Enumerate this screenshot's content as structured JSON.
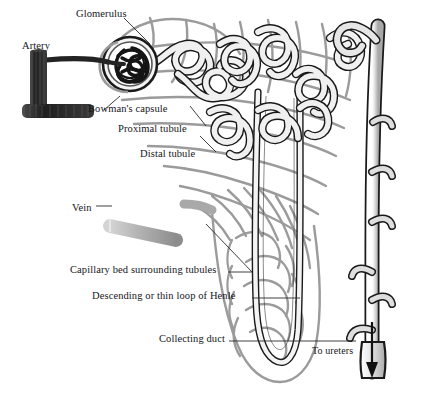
{
  "figure": {
    "alt": "Anatomical illustration of a kidney nephron showing glomerulus, Bowman's capsule, proximal and distal tubules, loop of Henle, surrounding capillary bed, collecting duct, artery and vein"
  },
  "labels": [
    {
      "id": "glomerulus",
      "text": "Glomerulus",
      "x": 76,
      "y": 8
    },
    {
      "id": "artery",
      "text": "Artery",
      "x": 22,
      "y": 40
    },
    {
      "id": "bowmans-capsule",
      "text": "Bowman's capsule",
      "x": 88,
      "y": 103
    },
    {
      "id": "proximal-tubule",
      "text": "Proximal tubule",
      "x": 118,
      "y": 123
    },
    {
      "id": "distal-tubule",
      "text": "Distal tubule",
      "x": 140,
      "y": 148
    },
    {
      "id": "vein",
      "text": "Vein",
      "x": 72,
      "y": 202
    },
    {
      "id": "capillary-bed",
      "text": "Capillary bed surrounding tubules",
      "x": 70,
      "y": 269
    },
    {
      "id": "loop-of-henle",
      "text": "Descending or thin loop of Henle",
      "x": 92,
      "y": 294
    },
    {
      "id": "collecting-duct",
      "text": "Collecting duct",
      "x": 159,
      "y": 337
    },
    {
      "id": "to-ureters",
      "text": "To ureters",
      "x": 312,
      "y": 350
    }
  ],
  "caption": " ",
  "colors": {
    "background": "#ffffff",
    "ink": "#16161a",
    "artery_dark": "#2e2e2e",
    "vein_gray": "#b3b3b3",
    "tubule_fill": "#f2f2f2",
    "tubule_outline": "#1a1a1a",
    "capillary_gray": "#9b9b9b",
    "leader_line": "#2a2a2a",
    "duct_fill": "#dcdcdc"
  }
}
